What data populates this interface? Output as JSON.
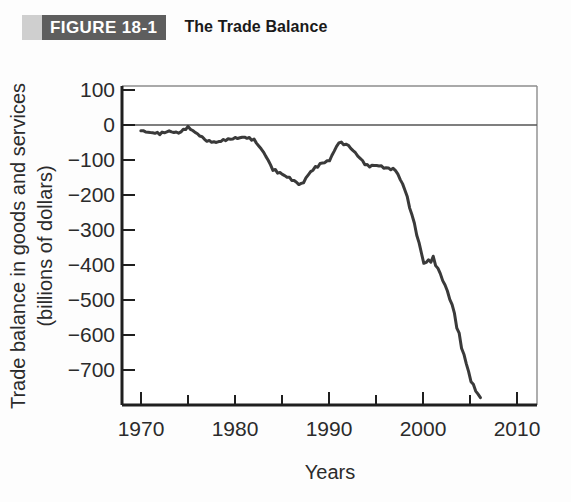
{
  "header": {
    "badge_tab": "",
    "badge_label": "FIGURE 18-1",
    "title": "The Trade Balance"
  },
  "colors": {
    "badge_background": "#5e5e5e",
    "badge_tab": "#cfcfcf",
    "badge_text": "#ffffff",
    "title_text": "#1a1a1a",
    "line": "#3a3a3a",
    "axis": "#1f1f1f",
    "frame": "#8c8c8c",
    "zero_line": "#555555",
    "plot_background": "#ffffff",
    "page_background": "#fdfdfd"
  },
  "chart_data": {
    "type": "line",
    "title": "The Trade Balance",
    "xlabel": "Years",
    "ylabel": "Trade balance in goods and services (billions of dollars)",
    "ylabel_line1": "Trade balance in goods and services",
    "ylabel_line2": "(billions of dollars)",
    "xlim": [
      1968,
      2012
    ],
    "ylim": [
      -780,
      130
    ],
    "grid": false,
    "legend": null,
    "xticks": [
      1970,
      1980,
      1990,
      2000,
      2010
    ],
    "xtick_labels": [
      "1970",
      "1980",
      "1990",
      "2000",
      "2010"
    ],
    "xminor_ticks": [
      1975,
      1985,
      1995,
      2005
    ],
    "yticks": [
      100,
      0,
      -100,
      -200,
      -300,
      -400,
      -500,
      -600,
      -700
    ],
    "ytick_labels": [
      "100",
      "0",
      "−100",
      "−200",
      "−300",
      "−400",
      "−500",
      "−600",
      "−700"
    ],
    "zero_reference_line": 0,
    "series": [
      {
        "name": "Trade balance in goods and services",
        "x": [
          1970,
          1971,
          1972,
          1973,
          1974,
          1975,
          1976,
          1977,
          1978,
          1979,
          1980,
          1981,
          1982,
          1983,
          1984,
          1985,
          1986,
          1987,
          1988,
          1989,
          1990,
          1991,
          1992,
          1993,
          1994,
          1995,
          1996,
          1997,
          1998,
          1999,
          2000,
          2001,
          2002,
          2003,
          2004,
          2005,
          2006
        ],
        "values": [
          2,
          -2,
          -6,
          1,
          -4,
          12,
          -6,
          -27,
          -30,
          -24,
          -19,
          -16,
          -24,
          -57,
          -109,
          -121,
          -138,
          -152,
          -114,
          -93,
          -81,
          -31,
          -39,
          -70,
          -98,
          -96,
          -104,
          -108,
          -166,
          -263,
          -377,
          -362,
          -421,
          -494,
          -611,
          -714,
          -759
        ]
      }
    ]
  }
}
